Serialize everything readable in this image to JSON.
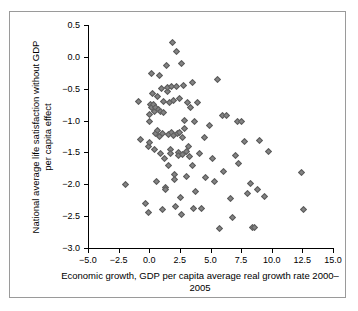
{
  "chart_data": {
    "type": "scatter",
    "title": "",
    "xlabel": "Economic growth, GDP per capita average real growth rate 2000–2005",
    "xlabel_line1": "Economic growth, GDP per capita average real growth",
    "xlabel_line2": "rate 2000–2005",
    "ylabel": "National average life satisfaction without GDP per capita effect",
    "ylabel_line1": "National average life satisfaction without GDP",
    "ylabel_line2": "per capita effect",
    "xlim": [
      -5.0,
      15.0
    ],
    "ylim": [
      -3.0,
      0.5
    ],
    "xticks": [
      -5.0,
      -2.5,
      0.0,
      2.5,
      5.0,
      7.5,
      10.0,
      12.5,
      15.0
    ],
    "yticks": [
      0.5,
      0.0,
      -0.5,
      -1.0,
      -1.5,
      -2.0,
      -2.5,
      -3.0
    ],
    "xticklabels": [
      "−5.0",
      "−2.5",
      "0.0",
      "2.5",
      "5.0",
      "7.5",
      "10.0",
      "12.5",
      "15.0"
    ],
    "yticklabels": [
      "0.5",
      "0.0",
      "−0.5",
      "−1.0",
      "−1.5",
      "−2.0",
      "−2.5",
      "−3.0"
    ],
    "grid": false,
    "legend": false,
    "marker": "diamond",
    "marker_color": "#838383",
    "marker_edge_color": "#5d5d5d",
    "points": [
      [
        -1.9,
        -2.0
      ],
      [
        -0.9,
        -0.7
      ],
      [
        -0.7,
        -1.3
      ],
      [
        -0.3,
        -2.3
      ],
      [
        -0.1,
        -2.45
      ],
      [
        -0.1,
        -1.4
      ],
      [
        0.0,
        -0.9
      ],
      [
        0.0,
        -1.35
      ],
      [
        0.05,
        -1.02
      ],
      [
        0.1,
        -0.75
      ],
      [
        0.15,
        -0.26
      ],
      [
        0.2,
        -0.8
      ],
      [
        0.3,
        -0.58
      ],
      [
        0.35,
        -0.74
      ],
      [
        0.4,
        -1.45
      ],
      [
        0.45,
        -0.86
      ],
      [
        0.5,
        -0.8
      ],
      [
        0.55,
        -1.2
      ],
      [
        0.6,
        -1.95
      ],
      [
        0.65,
        -1.16
      ],
      [
        0.7,
        -0.62
      ],
      [
        0.75,
        -0.83
      ],
      [
        0.8,
        -0.3
      ],
      [
        0.85,
        -1.25
      ],
      [
        0.9,
        -1.52
      ],
      [
        0.95,
        -0.85
      ],
      [
        1.0,
        -0.5
      ],
      [
        1.05,
        -2.4
      ],
      [
        1.1,
        -1.2
      ],
      [
        1.15,
        -0.7
      ],
      [
        1.2,
        -0.88
      ],
      [
        1.25,
        -1.6
      ],
      [
        1.3,
        -2.05
      ],
      [
        1.35,
        -2.08
      ],
      [
        1.4,
        -0.13
      ],
      [
        1.45,
        -0.55
      ],
      [
        1.5,
        -0.48
      ],
      [
        1.55,
        -1.22
      ],
      [
        1.6,
        -1.7
      ],
      [
        1.65,
        -0.72
      ],
      [
        1.7,
        -1.46
      ],
      [
        1.75,
        -1.52
      ],
      [
        1.8,
        -1.18
      ],
      [
        1.85,
        -0.47
      ],
      [
        1.9,
        0.22
      ],
      [
        1.95,
        -0.68
      ],
      [
        2.0,
        -1.24
      ],
      [
        2.05,
        -1.84
      ],
      [
        2.1,
        -1.93
      ],
      [
        2.15,
        -2.35
      ],
      [
        2.2,
        -0.46
      ],
      [
        2.25,
        0.08
      ],
      [
        2.3,
        -1.21
      ],
      [
        2.35,
        -1.5
      ],
      [
        2.4,
        -1.55
      ],
      [
        2.45,
        -0.66
      ],
      [
        2.5,
        -1.18
      ],
      [
        2.55,
        -2.2
      ],
      [
        2.6,
        -2.47
      ],
      [
        2.65,
        -0.1
      ],
      [
        2.7,
        -1.26
      ],
      [
        2.75,
        -1.53
      ],
      [
        2.8,
        -0.45
      ],
      [
        2.85,
        -1.0
      ],
      [
        2.9,
        -1.12
      ],
      [
        3.0,
        -1.48
      ],
      [
        3.05,
        -1.88
      ],
      [
        3.1,
        -0.72
      ],
      [
        3.2,
        -1.4
      ],
      [
        3.3,
        -1.56
      ],
      [
        3.4,
        -0.8
      ],
      [
        3.5,
        -0.41
      ],
      [
        3.55,
        -1.71
      ],
      [
        3.6,
        -2.38
      ],
      [
        3.7,
        -1.02
      ],
      [
        3.8,
        -2.12
      ],
      [
        3.9,
        -0.72
      ],
      [
        4.1,
        -1.51
      ],
      [
        4.3,
        -2.38
      ],
      [
        4.5,
        -1.26
      ],
      [
        4.6,
        -1.9
      ],
      [
        4.9,
        -1.08
      ],
      [
        5.2,
        -1.6
      ],
      [
        5.3,
        -1.95
      ],
      [
        5.6,
        -0.35
      ],
      [
        5.7,
        -2.7
      ],
      [
        6.0,
        -0.92
      ],
      [
        6.1,
        -1.8
      ],
      [
        6.3,
        -0.92
      ],
      [
        6.6,
        -2.23
      ],
      [
        6.8,
        -2.52
      ],
      [
        7.0,
        -1.55
      ],
      [
        7.2,
        -1.01
      ],
      [
        7.3,
        -1.68
      ],
      [
        7.5,
        -1.02
      ],
      [
        7.8,
        -1.33
      ],
      [
        8.0,
        -2.15
      ],
      [
        8.3,
        -1.98
      ],
      [
        8.4,
        -2.68
      ],
      [
        8.6,
        -2.68
      ],
      [
        8.8,
        -2.08
      ],
      [
        9.0,
        -1.31
      ],
      [
        9.4,
        -2.19
      ],
      [
        9.7,
        -1.48
      ],
      [
        12.4,
        -1.82
      ],
      [
        12.6,
        -2.4
      ]
    ]
  }
}
